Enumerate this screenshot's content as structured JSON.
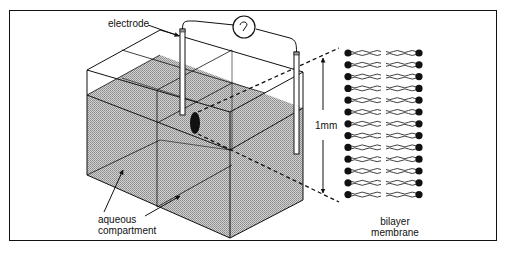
{
  "figure": {
    "labels": {
      "electrode": "electrode",
      "aqueous_line1": "aqueous",
      "aqueous_line2": "compartment",
      "scale": "1mm",
      "bilayer_line1": "bilayer",
      "bilayer_line2": "membrane"
    },
    "components": [
      {
        "name": "ammeter",
        "icon": "meter-dial-icon"
      },
      {
        "name": "left-electrode",
        "icon": "electrode-rod"
      },
      {
        "name": "right-electrode",
        "icon": "electrode-rod"
      },
      {
        "name": "aqueous-compartment-chamber",
        "icon": "box-3d"
      },
      {
        "name": "membrane-aperture",
        "icon": "black-ellipse"
      },
      {
        "name": "bilayer-membrane",
        "icon": "lipid-bilayer"
      }
    ],
    "bilayer": {
      "lipid_rows": 13
    },
    "colors": {
      "line": "#111111",
      "water_fill": "#b8b8b8",
      "background": "#ffffff"
    }
  }
}
